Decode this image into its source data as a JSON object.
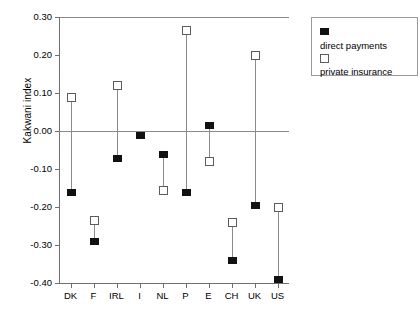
{
  "chart_data": {
    "type": "scatter",
    "title": "",
    "xlabel": "",
    "ylabel": "Kakwani index",
    "ylim": [
      -0.4,
      0.3
    ],
    "ytick_labels": [
      "0.30",
      "0.20",
      "0.10",
      "0.00",
      "-0.10",
      "-0.20",
      "-0.30",
      "-0.40"
    ],
    "ytick_values": [
      0.3,
      0.2,
      0.1,
      0.0,
      -0.1,
      -0.2,
      -0.3,
      -0.4
    ],
    "grid": false,
    "zero_line": true,
    "legend_position": "top-right",
    "categories": [
      "DK",
      "F",
      "IRL",
      "I",
      "NL",
      "P",
      "E",
      "CH",
      "UK",
      "US"
    ],
    "series": [
      {
        "name": "direct payments",
        "marker": "filled-square",
        "color": "#111111",
        "values": [
          -0.16,
          -0.29,
          -0.07,
          -0.01,
          -0.06,
          -0.16,
          0.015,
          -0.34,
          -0.195,
          -0.39
        ]
      },
      {
        "name": "private insurance",
        "marker": "open-square",
        "color": "#ffffff",
        "values": [
          0.09,
          -0.235,
          0.12,
          null,
          -0.155,
          0.267,
          -0.08,
          -0.24,
          0.2,
          -0.2
        ]
      }
    ]
  },
  "legend": {
    "items": [
      {
        "label": "direct payments",
        "marker": "filled-square"
      },
      {
        "label": "private insurance",
        "marker": "open-square"
      }
    ]
  },
  "axis": {
    "y_title": "Kakwani index"
  }
}
